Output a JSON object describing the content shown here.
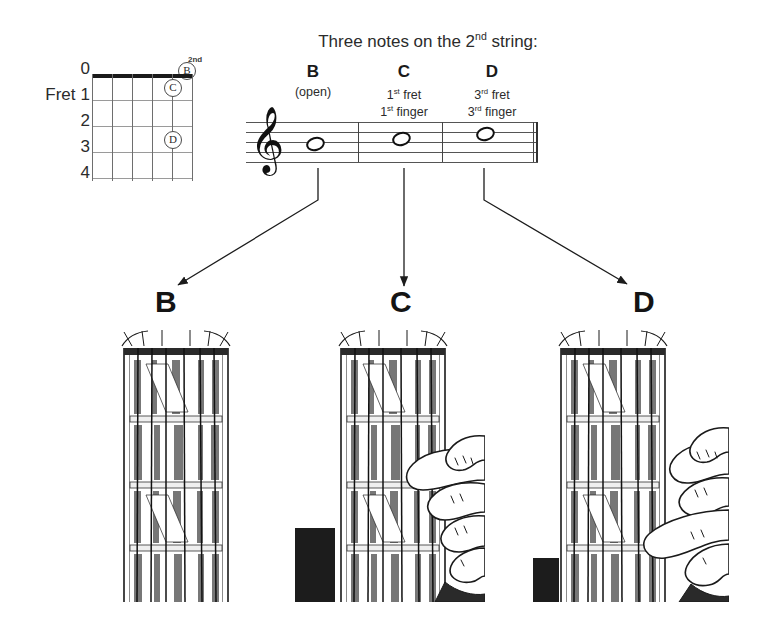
{
  "page": {
    "background": "#ffffff",
    "ink": "#1a1a1a"
  },
  "heading": {
    "text_before": "Three notes on the 2",
    "superscript": "nd",
    "text_after": " string:",
    "full_text": "Three notes on the 2nd string:"
  },
  "chord_diagram": {
    "fret_word": "Fret",
    "fret_numbers": [
      "0",
      "1",
      "2",
      "3",
      "4"
    ],
    "string_superscript": "2nd",
    "string_count": 6,
    "fret_count": 4,
    "markers": [
      {
        "label": "B",
        "position": "open-above-nut",
        "fret": 0,
        "string": 2
      },
      {
        "label": "C",
        "position": "fret-1",
        "fret": 1,
        "string": 2
      },
      {
        "label": "D",
        "position": "fret-3",
        "fret": 3,
        "string": 2
      }
    ]
  },
  "notes": [
    {
      "letter": "B",
      "detail_line1": "(open)",
      "detail_line2": "",
      "detail_sup1": "",
      "detail_sup2": ""
    },
    {
      "letter": "C",
      "detail_line1": "1",
      "detail_sup1": "st",
      "detail_line1_rest": " fret",
      "detail_line2": "1",
      "detail_sup2": "st",
      "detail_line2_rest": " finger"
    },
    {
      "letter": "D",
      "detail_line1": "3",
      "detail_sup1": "rd",
      "detail_line1_rest": " fret",
      "detail_line2": "3",
      "detail_sup2": "rd",
      "detail_line2_rest": " finger"
    }
  ],
  "staff": {
    "clef": "treble-clef",
    "clef_glyph": "𝄞",
    "line_count": 5,
    "measures": 3,
    "note_values": [
      "whole",
      "whole",
      "whole"
    ],
    "pitches": [
      "B",
      "C",
      "D"
    ],
    "staff_positions": [
      "middle-line",
      "third-space",
      "fourth-line"
    ]
  },
  "big_letters": {
    "b": "B",
    "c": "C",
    "d": "D"
  },
  "photos": [
    {
      "name": "photo-b",
      "caption_letter": "B",
      "description": "guitar-neck-open-string-no-hand"
    },
    {
      "name": "photo-c",
      "caption_letter": "C",
      "description": "guitar-neck-index-finger-first-fret"
    },
    {
      "name": "photo-d",
      "caption_letter": "D",
      "description": "guitar-neck-ring-finger-third-fret"
    }
  ]
}
